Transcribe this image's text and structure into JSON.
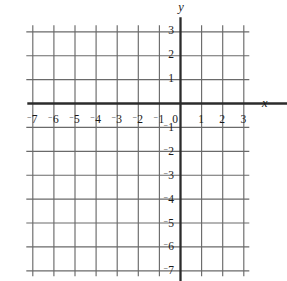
{
  "figure": {
    "type": "coordinate-grid",
    "background_color": "#ffffff",
    "axis_color": "#2b2b2b",
    "grid_color": "#6a6a6a",
    "text_color": "#1a1a1a"
  },
  "axes": {
    "x_axis_label": "x",
    "y_axis_label": "y",
    "origin_label": "0",
    "negative_sign_style": "raised-minus"
  },
  "chart_data": {
    "type": "scatter",
    "title": "",
    "subtitle": "",
    "xlabel": "x",
    "ylabel": "y",
    "grid": true,
    "legend": false,
    "legend_position": "none",
    "xlim": [
      -7,
      3
    ],
    "ylim": [
      -7,
      3
    ],
    "x_gridlines": [
      -7,
      -6,
      -5,
      -4,
      -3,
      -2,
      -1,
      0,
      1,
      2,
      3
    ],
    "y_gridlines": [
      3,
      2,
      1,
      0,
      -1,
      -2,
      -3,
      -4,
      -5,
      -6,
      -7
    ],
    "x_tick_values": [
      -7,
      -6,
      -5,
      -4,
      -3,
      -2,
      -1,
      1,
      2,
      3
    ],
    "y_tick_values": [
      3,
      2,
      1,
      -1,
      -2,
      -3,
      -4,
      -5,
      -6,
      -7
    ],
    "x_tick_labels": [
      "⁻7",
      "⁻6",
      "⁻5",
      "⁻4",
      "⁻3",
      "⁻2",
      "⁻1",
      "1",
      "2",
      "3"
    ],
    "y_tick_labels": [
      "3",
      "2",
      "1",
      "⁻1",
      "⁻2",
      "⁻3",
      "⁻4",
      "⁻5",
      "⁻6",
      "⁻7"
    ],
    "series": [],
    "values": [],
    "x": [],
    "annotations": []
  },
  "ticks": {
    "x": [
      {
        "value": -7,
        "digits": "7",
        "negative": true
      },
      {
        "value": -6,
        "digits": "6",
        "negative": true
      },
      {
        "value": -5,
        "digits": "5",
        "negative": true
      },
      {
        "value": -4,
        "digits": "4",
        "negative": true
      },
      {
        "value": -3,
        "digits": "3",
        "negative": true
      },
      {
        "value": -2,
        "digits": "2",
        "negative": true
      },
      {
        "value": -1,
        "digits": "1",
        "negative": true
      },
      {
        "value": 1,
        "digits": "1",
        "negative": false
      },
      {
        "value": 2,
        "digits": "2",
        "negative": false
      },
      {
        "value": 3,
        "digits": "3",
        "negative": false
      }
    ],
    "y": [
      {
        "value": 3,
        "digits": "3",
        "negative": false
      },
      {
        "value": 2,
        "digits": "2",
        "negative": false
      },
      {
        "value": 1,
        "digits": "1",
        "negative": false
      },
      {
        "value": -1,
        "digits": "1",
        "negative": true
      },
      {
        "value": -2,
        "digits": "2",
        "negative": true
      },
      {
        "value": -3,
        "digits": "3",
        "negative": true
      },
      {
        "value": -4,
        "digits": "4",
        "negative": true
      },
      {
        "value": -5,
        "digits": "5",
        "negative": true
      },
      {
        "value": -6,
        "digits": "6",
        "negative": true
      },
      {
        "value": -7,
        "digits": "7",
        "negative": true
      }
    ]
  },
  "geometry": {
    "origin_x": 180,
    "origin_y": 103,
    "unit_x": 21.1,
    "unit_y": 23.9,
    "grid_x_min": -7,
    "grid_x_max": 3,
    "grid_y_min": -7,
    "grid_y_max": 3,
    "grid_overhang": 6,
    "axis_overhang_left": 5,
    "axis_overhang_right": 72,
    "axis_overhang_top": 14,
    "axis_overhang_bottom": 36,
    "x_label_offset": 11,
    "y_label_offset": 6,
    "x_axis_name_offset": 82,
    "y_axis_name_offset": 30
  }
}
